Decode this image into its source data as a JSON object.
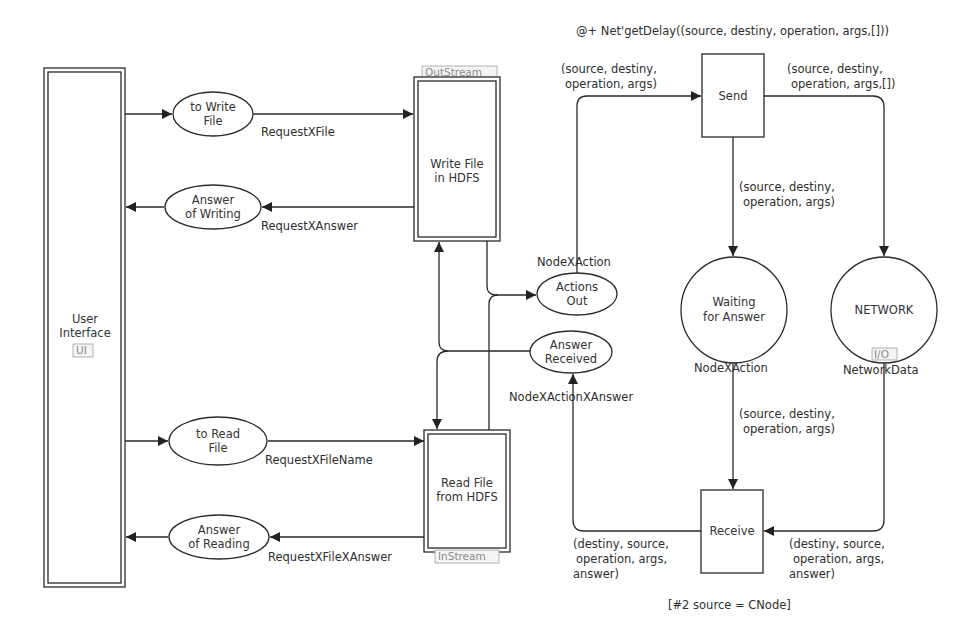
{
  "diagram": {
    "type": "colored-petri-net",
    "substitution_transitions": {
      "user_interface": {
        "label_line1": "User",
        "label_line2": "Interface",
        "tag": "UI"
      },
      "write_file": {
        "label_line1": "Write File",
        "label_line2": "in HDFS",
        "tag": "OutStream"
      },
      "read_file": {
        "label_line1": "Read File",
        "label_line2": "from HDFS",
        "tag": "InStream"
      }
    },
    "transitions": {
      "send": {
        "label": "Send",
        "time_inscription": "@+ Net'getDelay((source, destiny, operation, args,[]))"
      },
      "receive": {
        "label": "Receive",
        "guard": "[#2 source = CNode]"
      }
    },
    "places": {
      "to_write_file": {
        "label_line1": "to Write",
        "label_line2": "File",
        "color_set": "RequestXFile"
      },
      "answer_of_writing": {
        "label_line1": "Answer",
        "label_line2": "of Writing",
        "color_set": "RequestXAnswer"
      },
      "to_read_file": {
        "label_line1": "to Read",
        "label_line2": "File",
        "color_set": "RequestXFileName"
      },
      "answer_of_reading": {
        "label_line1": "Answer",
        "label_line2": "of Reading",
        "color_set": "RequestXFileXAnswer"
      },
      "actions_out": {
        "label_line1": "Actions",
        "label_line2": "Out",
        "color_set": "NodeXAction"
      },
      "answer_received": {
        "label_line1": "Answer",
        "label_line2": "Received",
        "color_set": "NodeXActionXAnswer"
      },
      "waiting_for_answer": {
        "label_line1": "Waiting",
        "label_line2": "for Answer",
        "color_set": "NodeXAction"
      },
      "network": {
        "label": "NETWORK",
        "color_set": "NetworkData",
        "port_tag": "I/O"
      }
    },
    "arc_inscriptions": {
      "actions_to_send": {
        "line1": "(source, destiny,",
        "line2": "operation, args)"
      },
      "send_to_network": {
        "line1": "(source, destiny,",
        "line2": "operation, args,[])"
      },
      "send_to_waiting": {
        "line1": "(source, destiny,",
        "line2": "operation, args)"
      },
      "waiting_to_receive": {
        "line1": "(source, destiny,",
        "line2": "operation, args)"
      },
      "receive_to_answer": {
        "line1": "(destiny, source,",
        "line2": "operation, args,",
        "line3": "answer)"
      },
      "network_to_receive": {
        "line1": "(destiny, source,",
        "line2": "operation, args,",
        "line3": "answer)"
      }
    }
  }
}
